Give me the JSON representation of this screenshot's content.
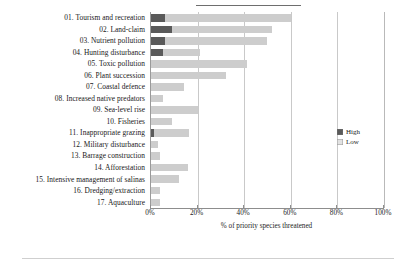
{
  "chart_data": {
    "type": "bar",
    "orientation": "horizontal",
    "stacked": true,
    "title": "",
    "xlabel": "% of priority species threatened",
    "ylabel": "",
    "xlim": [
      0,
      100
    ],
    "xticks": [
      0,
      20,
      40,
      60,
      80,
      100
    ],
    "xticklabels": [
      "0%",
      "20%",
      "40%",
      "60%",
      "80%",
      "100%"
    ],
    "grid": true,
    "legend_position": "right",
    "categories": [
      "01. Tourism and recreation",
      "02. Land-claim",
      "03. Nutrient pollution",
      "04. Hunting disturbance",
      "05. Toxic pollution",
      "06. Plant succession",
      "07. Coastal defence",
      "08. Increased native predators",
      "09. Sea-level rise",
      "10. Fisheries",
      "11. Inappropriate grazing",
      "12. Military disturbance",
      "13. Barrage construction",
      "14. Afforestation",
      "15. Intensive management of salinas",
      "16. Dredging/extraction",
      "17. Aquaculture"
    ],
    "series": [
      {
        "name": "High",
        "color": "#5a5a5a",
        "values": [
          6,
          9,
          6,
          5,
          0,
          0,
          0,
          0,
          0,
          0,
          1.5,
          0,
          0,
          0,
          0,
          0,
          0
        ]
      },
      {
        "name": "Low",
        "color": "#cdcdcd",
        "values": [
          54,
          43,
          44,
          16,
          41,
          32,
          14,
          5,
          20,
          9,
          15,
          3,
          4,
          16,
          12,
          4,
          4
        ]
      }
    ],
    "totals": [
      60,
      52,
      50,
      21,
      41,
      32,
      14,
      5,
      20,
      9,
      16.5,
      3,
      4,
      16,
      12,
      4,
      4
    ]
  },
  "legend": {
    "items": [
      {
        "label": "High",
        "color": "#5a5a5a"
      },
      {
        "label": "Low",
        "color": "#e2e2e2"
      }
    ]
  }
}
